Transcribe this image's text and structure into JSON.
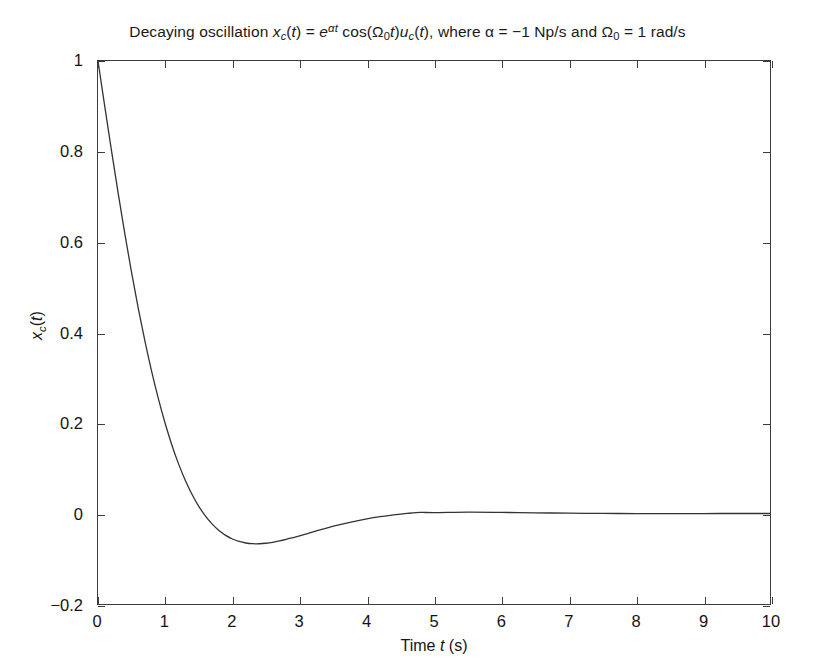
{
  "chart_data": {
    "type": "line",
    "title_parts": {
      "lead": "Decaying oscillation ",
      "x_base": "x",
      "x_sub": "c",
      "x_arg": "(",
      "x_arg_var": "t",
      "x_arg_close": ") = ",
      "e_base": "e",
      "e_sup_alpha": "α",
      "e_sup_t": "t",
      "cos_fn": " cos(",
      "omega_base": "Ω",
      "omega_sub": "0",
      "omega_t": "t",
      "cos_close": ")",
      "u_base": "u",
      "u_sub": "c",
      "u_open": "(",
      "u_var": "t",
      "u_close": "), ",
      "where": "where ",
      "alpha_sym": "α",
      "alpha_val": " = −1 Np/s and ",
      "omega2_base": "Ω",
      "omega2_sub": "0",
      "omega2_val": " = 1 rad/s"
    },
    "xlabel_parts": {
      "lead": "Time ",
      "var": "t",
      "unit": " (s)"
    },
    "ylabel_parts": {
      "base": "x",
      "sub": "c",
      "open": "(",
      "var": "t",
      "close": ")"
    },
    "xlabel": "Time t (s)",
    "ylabel": "x_c(t)",
    "xlim": [
      0,
      10
    ],
    "ylim": [
      -0.2,
      1.0
    ],
    "xticks": [
      0,
      1,
      2,
      3,
      4,
      5,
      6,
      7,
      8,
      9,
      10
    ],
    "xtick_labels": [
      "0",
      "1",
      "2",
      "3",
      "4",
      "5",
      "6",
      "7",
      "8",
      "9",
      "10"
    ],
    "yticks": [
      -0.2,
      0,
      0.2,
      0.4,
      0.6,
      0.8,
      1
    ],
    "ytick_labels": [
      "−0.2",
      "0",
      "0.2",
      "0.4",
      "0.6",
      "0.8",
      "1"
    ],
    "grid": false,
    "legend": null,
    "line_color": "#333333",
    "line_width": 1.3,
    "background": "#ffffff",
    "axis_color": "#3c3c3c",
    "equation": {
      "form": "exp(alpha*t)*cos(Omega0*t)*u(t)",
      "alpha": -1,
      "alpha_units": "Np/s",
      "Omega0": 1,
      "Omega0_units": "rad/s"
    },
    "annotations": {
      "zero_crossing_t": 1.5708,
      "minimum_t": 2.3562,
      "minimum_value": -0.067
    },
    "x": [
      0,
      0.1,
      0.2,
      0.3,
      0.4,
      0.5,
      0.6,
      0.7,
      0.8,
      0.9,
      1,
      1.1,
      1.2,
      1.3,
      1.4,
      1.5,
      1.6,
      1.7,
      1.8,
      1.9,
      2,
      2.1,
      2.2,
      2.3,
      2.4,
      2.5,
      2.6,
      2.7,
      2.8,
      2.9,
      3,
      3.2,
      3.4,
      3.6,
      3.8,
      4,
      4.2,
      4.4,
      4.6,
      4.8,
      5,
      5.5,
      6,
      6.5,
      7,
      7.5,
      8,
      8.5,
      9,
      9.5,
      10
    ],
    "y": [
      1,
      0.9003,
      0.8024,
      0.7078,
      0.6174,
      0.5323,
      0.453,
      0.3798,
      0.3131,
      0.2527,
      0.1988,
      0.151,
      0.1091,
      0.0729,
      0.042,
      0.0158,
      -0.0059,
      -0.0236,
      -0.0376,
      -0.0484,
      -0.0563,
      -0.0618,
      -0.0652,
      -0.0668,
      -0.0669,
      -0.0657,
      -0.0636,
      -0.0607,
      -0.0572,
      -0.0533,
      -0.0493,
      -0.0407,
      -0.0324,
      -0.0248,
      -0.018,
      -0.012,
      -0.0071,
      -0.0031,
      0.0001,
      0.0024,
      0.0019,
      0.0029,
      0.0024,
      0.0015,
      0.0007,
      0.0002,
      -0.0001,
      -0.0002,
      -0.0001,
      0.0,
      0.0
    ]
  }
}
